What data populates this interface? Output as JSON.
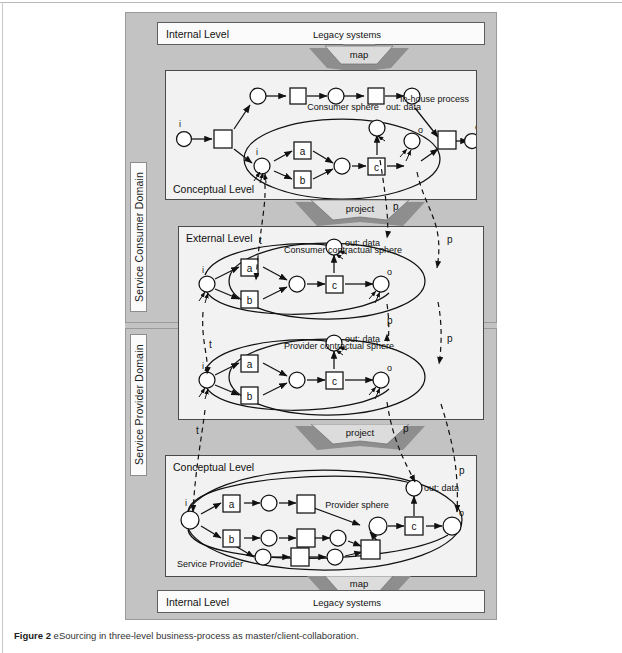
{
  "figure": {
    "caption_label": "Figure 2",
    "caption_text": "eSourcing in three-level business-process as master/client-collaboration."
  },
  "domains": [
    {
      "id": "consumer",
      "label": "Service Consumer Domain"
    },
    {
      "id": "provider",
      "label": "Service Provider Domain"
    }
  ],
  "levels": {
    "consumer_internal": {
      "title": "Internal Level",
      "subtitle": "Legacy systems"
    },
    "consumer_conceptual": {
      "title": "Conceptual Level",
      "sphere": "Consumer sphere",
      "note": "In-house process",
      "out": "out: data"
    },
    "consumer_external": {
      "title": "External Level",
      "sphere": "Consumer contractual sphere",
      "out": "out: data"
    },
    "provider_external": {
      "sphere": "Provider contractual sphere",
      "out": "out: data"
    },
    "provider_conceptual": {
      "title": "Conceptual Level",
      "sphere": "Provider sphere",
      "footer": "Service Provider",
      "out": "out: data"
    },
    "provider_internal": {
      "title": "Internal Level",
      "subtitle": "Legacy systems"
    }
  },
  "transitions": {
    "map_top": "map",
    "project_top": "project",
    "project_bottom": "project",
    "map_bottom": "map"
  },
  "node_labels": {
    "a": "a",
    "b": "b",
    "c": "c",
    "i": "i",
    "o": "o",
    "t": "t",
    "p": "p"
  },
  "correspondence_markers": {
    "consumer_conceptual_to_external": [
      "t",
      "p"
    ],
    "external_to_external": [
      "t",
      "p"
    ],
    "provider_external_to_conceptual": [
      "t",
      "p"
    ]
  },
  "colors": {
    "figure_bg": "#c3c3c3",
    "panel_bg": "#f2f2f2",
    "level_bg": "#fbfbfb",
    "band_fill_light": "#d8d8d8",
    "band_fill_dark": "#8e8e8e",
    "stroke": "#111111"
  }
}
